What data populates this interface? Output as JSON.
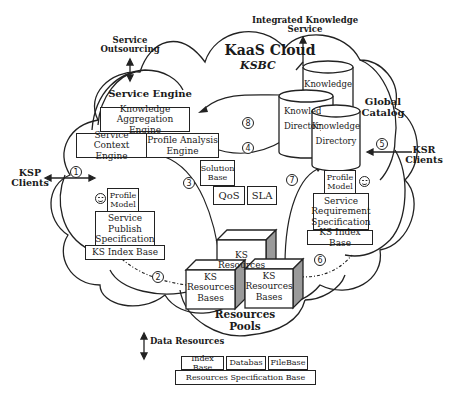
{
  "diagram": {
    "title": "KaaS Cloud",
    "subtitle": "KSBC",
    "external": {
      "service_outsourcing": [
        "Service",
        "Outsourcing"
      ],
      "integrated_knowledge_service": [
        "Integrated Knowledge",
        "Service"
      ],
      "ksp_clients": [
        "KSP",
        "Clients"
      ],
      "ksr_clients": [
        "KSR",
        "Clients"
      ],
      "data_resources": "Data Resources"
    },
    "service_engine": {
      "title": "Service Engine",
      "knowledge_aggregation_engine": [
        "Knowledge",
        "Aggregation Engine"
      ],
      "service_context_engine": [
        "Service Context",
        "Engine"
      ],
      "profile_analysis_engine": [
        "Profile Analysis",
        "Engine"
      ]
    },
    "global_catalog": {
      "title": [
        "Global",
        "Catalog"
      ],
      "cylinders": [
        {
          "label": [
            "Knowledge",
            "Library"
          ]
        },
        {
          "label": [
            "Knowledge",
            "Directory"
          ]
        },
        {
          "label": [
            "Knowledge",
            "Directory"
          ]
        }
      ]
    },
    "solution_base": {
      "title": [
        "Solution",
        "Base"
      ],
      "qos": "QoS",
      "sla": "SLA"
    },
    "ksp_side": {
      "profile_model": [
        "Profile",
        "Model"
      ],
      "service_publish_spec": [
        "Service",
        "Publish",
        "Specification"
      ],
      "ks_index_base": "KS Index Base"
    },
    "ksr_side": {
      "profile_model": [
        "Profile",
        "Model"
      ],
      "service_requirement_spec": [
        "Service",
        "Requirement",
        "Specification"
      ],
      "ks_index_base": "KS Index Base"
    },
    "resources_pools": {
      "title": [
        "Resources",
        "Pools"
      ],
      "ks_resources": [
        "KS",
        "Resources"
      ],
      "ks_resources_bases_left": [
        "KS",
        "Resources",
        "Bases"
      ],
      "ks_resources_bases_right": [
        "KS",
        "Resources",
        "Bases"
      ]
    },
    "resources_spec_base": {
      "items": [
        "Index Base",
        "Databas",
        "FileBase"
      ],
      "base": "Resources Specification Base"
    },
    "flow_numbers": [
      "1",
      "2",
      "3",
      "4",
      "5",
      "6",
      "7",
      "8"
    ]
  }
}
